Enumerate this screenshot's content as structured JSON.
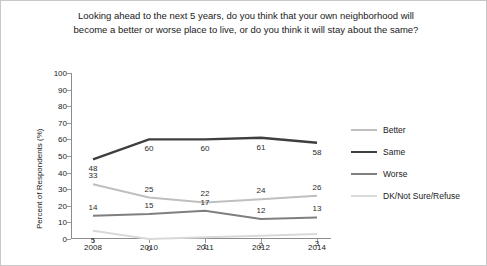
{
  "chart_data": {
    "type": "line",
    "title": "Looking ahead to the next 5 years, do you think that your own neighborhood will become a better or worse place to live, or do you think it will stay about the same?",
    "xlabel": "",
    "ylabel": "Percent of Respondents (%)",
    "categories": [
      "2008",
      "2010",
      "2011",
      "2012",
      "2014"
    ],
    "ylim": [
      0,
      100
    ],
    "yticks": [
      0,
      10,
      20,
      30,
      40,
      50,
      60,
      70,
      80,
      90,
      100
    ],
    "grid": false,
    "legend_position": "right",
    "series": [
      {
        "name": "Better",
        "color": "#bfbfbf",
        "values": [
          33,
          25,
          22,
          24,
          26
        ]
      },
      {
        "name": "Same",
        "color": "#3f3f3f",
        "values": [
          48,
          60,
          60,
          61,
          58
        ]
      },
      {
        "name": "Worse",
        "color": "#7f7f7f",
        "values": [
          14,
          15,
          17,
          12,
          13
        ]
      },
      {
        "name": "DK/Not Sure/Refuse",
        "color": "#d9d9d9",
        "values": [
          5,
          0,
          1,
          2,
          3
        ]
      }
    ],
    "point_labels": {
      "Better": [
        "33",
        "25",
        "22",
        "24",
        "26"
      ],
      "Same": [
        "48",
        "60",
        "60",
        "61",
        "58"
      ],
      "Worse": [
        "14",
        "15",
        "17",
        "12",
        "13"
      ],
      "DK/Not Sure/Refuse": [
        "5",
        "0",
        "1",
        "2",
        "3"
      ]
    }
  }
}
